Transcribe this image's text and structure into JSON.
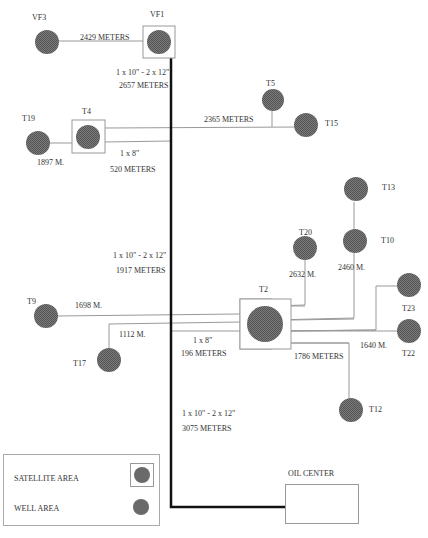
{
  "diagram": {
    "colors": {
      "well_fill": "#6a6a6a",
      "line": "#999999",
      "main_pipe": "#111111",
      "box_border": "#999999"
    },
    "nodes": [
      {
        "id": "VF3",
        "label": "VF3",
        "type": "well"
      },
      {
        "id": "VF1",
        "label": "VF1",
        "type": "satellite"
      },
      {
        "id": "T19",
        "label": "T19",
        "type": "well"
      },
      {
        "id": "T4",
        "label": "T4",
        "type": "satellite"
      },
      {
        "id": "T5",
        "label": "T5",
        "type": "well"
      },
      {
        "id": "T15",
        "label": "T15",
        "type": "well"
      },
      {
        "id": "T13",
        "label": "T13",
        "type": "well"
      },
      {
        "id": "T10",
        "label": "T10",
        "type": "well"
      },
      {
        "id": "T20",
        "label": "T20",
        "type": "well"
      },
      {
        "id": "T2",
        "label": "T2",
        "type": "satellite"
      },
      {
        "id": "T23",
        "label": "T23",
        "type": "well"
      },
      {
        "id": "T22",
        "label": "T22",
        "type": "well"
      },
      {
        "id": "T9",
        "label": "T9",
        "type": "well"
      },
      {
        "id": "T17",
        "label": "T17",
        "type": "well"
      },
      {
        "id": "T12",
        "label": "T12",
        "type": "well"
      },
      {
        "id": "OIL_CENTER",
        "label": "OIL CENTER",
        "type": "center"
      }
    ],
    "edge_labels": {
      "vf3_vf1": "2429 METERS",
      "vf1_main_spec": "1 x 10\" - 2 x 12\"",
      "vf1_main_len": "2657 METERS",
      "t4_t15": "2365 METERS",
      "t19_t4": "1897 M.",
      "t4_main_spec": "1 x 8\"",
      "t4_main_len": "520 METERS",
      "mid_main_spec": "1 x 10\" - 2 x 12\"",
      "mid_main_len": "1917 METERS",
      "t20": "2632 M.",
      "t10": "2460 M.",
      "t9": "1698 M.",
      "t17": "1112 M.",
      "t2_main_spec": "1 x 8\"",
      "t2_main_len": "196 METERS",
      "t12": "1786 METERS",
      "t22_t23": "1640 M.",
      "low_main_spec": "1 x 10\" - 2 x 12\"",
      "low_main_len": "3075 METERS"
    },
    "legend": {
      "satellite_area": "SATELLITE AREA",
      "well_area": "WELL AREA"
    }
  }
}
